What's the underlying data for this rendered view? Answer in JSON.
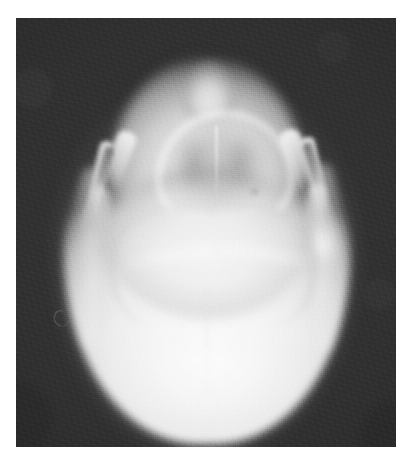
{
  "document": {
    "kind": "radiograph",
    "modality": "X-ray",
    "view": "Submentovertex (axial) skull projection",
    "caption": "",
    "background_color": "#ffffff",
    "film_color": "#2d2d2d",
    "bone_highlight_color": "#fafafa",
    "film": {
      "x": 16,
      "y": 18,
      "width": 380,
      "height": 429
    }
  },
  "anatomy": {
    "structures": [
      {
        "id": "cranial-vault",
        "label": "Cranial vault",
        "region": "posterior",
        "density": "high"
      },
      {
        "id": "anterior-mandible",
        "label": "Anterior mandible / chin",
        "region": "anterior",
        "density": "high"
      },
      {
        "id": "nasal-airway",
        "label": "Nasal / pharyngeal airway",
        "region": "anterior-mid",
        "density": "low"
      },
      {
        "id": "nasal-septum",
        "label": "Nasal septum / vomer",
        "region": "midline",
        "density": "high"
      },
      {
        "id": "nasal-fossa-left",
        "label": "Left nasal fossa",
        "region": "anterior-mid",
        "density": "low"
      },
      {
        "id": "nasal-fossa-right",
        "label": "Right nasal fossa",
        "region": "anterior-mid",
        "density": "low"
      },
      {
        "id": "hard-palate",
        "label": "Hard palate / alveolar arch",
        "region": "anterior",
        "density": "high"
      },
      {
        "id": "zygomatic-arch-left",
        "label": "Left zygomatic arch",
        "region": "lateral-left",
        "density": "high"
      },
      {
        "id": "zygomatic-arch-right",
        "label": "Right zygomatic arch",
        "region": "lateral-right",
        "density": "high"
      },
      {
        "id": "mandibular-notch-left",
        "label": "Left mandibular notch",
        "region": "lateral-left",
        "density": "low"
      },
      {
        "id": "mandibular-notch-right",
        "label": "Right mandibular notch",
        "region": "lateral-right",
        "density": "low"
      },
      {
        "id": "ramus-left",
        "label": "Left mandibular ramus",
        "region": "lateral-left",
        "density": "medium"
      },
      {
        "id": "ramus-right",
        "label": "Right mandibular ramus",
        "region": "lateral-right",
        "density": "medium"
      },
      {
        "id": "mastoid-right",
        "label": "Right mastoid / condyle",
        "region": "lateral-right",
        "density": "high"
      },
      {
        "id": "petrous-ridge-left",
        "label": "Left petrous ridge",
        "region": "skull-base",
        "density": "high"
      },
      {
        "id": "petrous-ridge-right",
        "label": "Right petrous ridge",
        "region": "skull-base",
        "density": "high"
      },
      {
        "id": "sagittal-midline",
        "label": "Sagittal midline",
        "region": "posterior",
        "density": "medium"
      },
      {
        "id": "occiput",
        "label": "Occipital bone",
        "region": "posterior",
        "density": "medium"
      },
      {
        "id": "fiducial-marker",
        "label": "Film fiducial marker",
        "region": "background",
        "density": "low"
      }
    ]
  }
}
